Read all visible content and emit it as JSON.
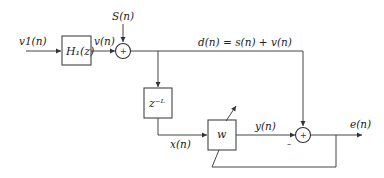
{
  "diagram": {
    "type": "adaptive-filter-block-diagram",
    "signals": {
      "input": "v1(n)",
      "h1_output": "v(n)",
      "source": "S(n)",
      "desired": "d(n) = s(n) + v(n)",
      "delayed": "x(n)",
      "filter_output": "y(n)",
      "error": "e(n)"
    },
    "blocks": {
      "h1": "H₁(z)",
      "delay": "z⁻ᴸ",
      "adaptive_filter": "w"
    },
    "summers": {
      "input_sum_sign": "+",
      "output_sum_sign": "+",
      "output_sum_minus": "–"
    },
    "colors": {
      "line": "#444444",
      "text": "#222222",
      "background": "#ffffff"
    }
  }
}
